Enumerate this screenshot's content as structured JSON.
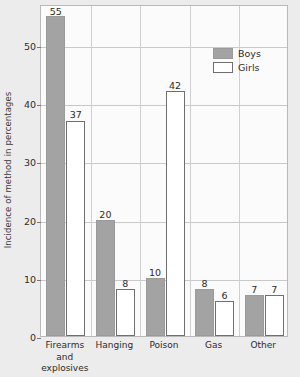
{
  "chart_data": {
    "type": "bar",
    "title": "",
    "xlabel": "",
    "ylabel": "Incidence of method in percentages",
    "categories": [
      "Firearms and explosives",
      "Hanging",
      "Poison",
      "Gas",
      "Other"
    ],
    "category_label_lines": [
      [
        "Firearms",
        "and",
        "explosives"
      ],
      [
        "Hanging"
      ],
      [
        "Poison"
      ],
      [
        "Gas"
      ],
      [
        "Other"
      ]
    ],
    "series": [
      {
        "name": "Boys",
        "values": [
          55,
          20,
          10,
          8,
          7
        ],
        "color": "#a3a3a3"
      },
      {
        "name": "Girls",
        "values": [
          37,
          8,
          42,
          6,
          7
        ],
        "color": "#ffffff"
      }
    ],
    "ylim": [
      0,
      57
    ],
    "yticks": [
      0,
      10,
      20,
      30,
      40,
      50
    ],
    "ytick_labels": [
      "0",
      "10",
      "20",
      "30",
      "40",
      "50"
    ],
    "grid": true,
    "legend_position": "top-right",
    "legend_entries": [
      "Boys",
      "Girls"
    ],
    "value_labels_shown": true
  },
  "legend": {
    "boys_label": "Boys",
    "girls_label": "Girls"
  },
  "axis": {
    "y_title": "Incidence of method in percentages"
  }
}
